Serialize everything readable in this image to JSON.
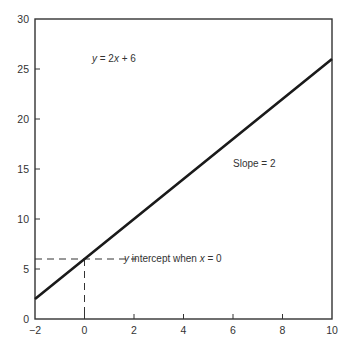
{
  "chart_data": {
    "type": "line",
    "title": "",
    "xlabel": "",
    "ylabel": "",
    "xlim": [
      -2,
      10
    ],
    "ylim": [
      0,
      30
    ],
    "grid": false,
    "legend": null,
    "x_ticks": [
      -2,
      0,
      2,
      4,
      6,
      8,
      10
    ],
    "x_tick_labels": [
      "−2",
      "0",
      "2",
      "4",
      "6",
      "8",
      "10"
    ],
    "y_ticks": [
      0,
      5,
      10,
      15,
      20,
      25,
      30
    ],
    "y_tick_labels": [
      "0",
      "5",
      "10",
      "15",
      "20",
      "25",
      "30"
    ],
    "series": [
      {
        "name": "y = 2x + 6",
        "equation": {
          "slope": 2,
          "intercept": 6
        },
        "x": [
          -2,
          0,
          2,
          4,
          6,
          8,
          10
        ],
        "y": [
          2,
          6,
          10,
          14,
          18,
          22,
          26
        ]
      }
    ],
    "reference_lines": [
      {
        "type": "horizontal-dashed",
        "y": 6,
        "x_from": -2,
        "x_to": 0
      },
      {
        "type": "vertical-dashed",
        "x": 0,
        "y_from": 0,
        "y_to": 6
      }
    ],
    "annotations": [
      {
        "text_parts": [
          "y",
          " = 2",
          "x",
          " + 6"
        ],
        "position": {
          "x": 0.3,
          "y": 26
        }
      },
      {
        "text": "Slope = 2",
        "position": {
          "x": 6,
          "y": 15.5
        }
      },
      {
        "text_parts": [
          "y",
          " intercept when ",
          "x",
          " = 0"
        ],
        "position": {
          "x": 1.6,
          "y": 6
        }
      }
    ]
  },
  "colors": {
    "line": "#1a1a1a",
    "axes": "#333333",
    "text": "#333333",
    "background": "#ffffff"
  }
}
